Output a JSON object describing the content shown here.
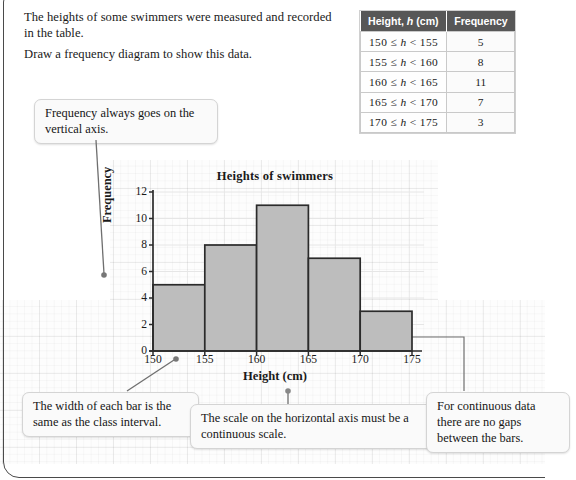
{
  "intro": {
    "line1": "The heights of some swimmers were measured and recorded in the table.",
    "line2": "Draw a frequency diagram to show this data."
  },
  "table": {
    "headers": [
      "Height, h (cm)",
      "Frequency"
    ],
    "header_height_prefix": "Height, ",
    "header_height_var": "h",
    "header_height_suffix": " (cm)",
    "header_frequency": "Frequency",
    "rows": [
      {
        "class_interval": "150 ≤ h < 155",
        "lower": "150",
        "upper": "155",
        "frequency": "5"
      },
      {
        "class_interval": "155 ≤ h < 160",
        "lower": "155",
        "upper": "160",
        "frequency": "8"
      },
      {
        "class_interval": "160 ≤ h < 165",
        "lower": "160",
        "upper": "165",
        "frequency": "11"
      },
      {
        "class_interval": "165 ≤ h < 170",
        "lower": "165",
        "upper": "170",
        "frequency": "7"
      },
      {
        "class_interval": "170 ≤ h < 175",
        "lower": "170",
        "upper": "175",
        "frequency": "3"
      }
    ],
    "header_bg": "#575757",
    "header_fg": "#ffffff"
  },
  "callouts": {
    "vertical_axis": "Frequency always goes on the vertical axis.",
    "bar_width": "The width of each bar is the same as the class interval.",
    "continuous_scale": "The scale on the horizontal axis must be a continuous scale.",
    "no_gaps": "For continuous data there are no gaps between the bars."
  },
  "chart_data": {
    "type": "bar",
    "title": "Heights of swimmers",
    "xlabel": "Height (cm)",
    "ylabel": "Frequency",
    "categories": [
      "150 ≤ h < 155",
      "155 ≤ h < 160",
      "160 ≤ h < 165",
      "165 ≤ h < 170",
      "170 ≤ h < 175"
    ],
    "bin_edges": [
      150,
      155,
      160,
      165,
      170,
      175
    ],
    "values": [
      5,
      8,
      11,
      7,
      3
    ],
    "xlim": [
      150,
      175
    ],
    "ylim": [
      0,
      12
    ],
    "xticks": [
      "150",
      "155",
      "160",
      "165",
      "170",
      "175"
    ],
    "yticks": [
      "0",
      "2",
      "4",
      "6",
      "8",
      "10",
      "12"
    ],
    "ytick_step": 2,
    "grid": true,
    "legend": false,
    "bar_fill": "#bdbdbd",
    "bar_stroke": "#2b2b2b",
    "axis_color": "#2b2b2b"
  }
}
